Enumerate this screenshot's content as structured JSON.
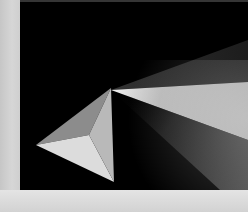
{
  "image": {
    "subject": "prism-light-beam",
    "description": "Three-faced pyramid on black background with a light beam fanning out from its apex",
    "colors": {
      "background": "#000000",
      "frame_light": "#cfcfcf",
      "face_top": "#8c8c8c",
      "face_bottom": "#dcdcdc",
      "face_right": "#b9b9b9",
      "beam_bright": "#e8e8e8"
    }
  }
}
